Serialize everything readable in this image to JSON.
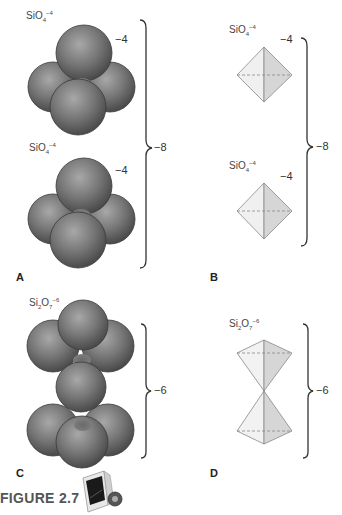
{
  "figure": {
    "caption": "FIGURE 2.7",
    "icon": "animation-monitor-icon"
  },
  "panels": {
    "A": {
      "label": "A",
      "type": "space-filling",
      "top": {
        "formula_base": "SiO",
        "formula_sub": "4",
        "formula_sup": "−4",
        "charge": "−4"
      },
      "bottom": {
        "formula_base": "SiO",
        "formula_sub": "4",
        "formula_sup": "−4",
        "charge": "−4"
      },
      "total_charge": "−8"
    },
    "B": {
      "label": "B",
      "type": "polyhedral",
      "top": {
        "formula_base": "SiO",
        "formula_sub": "4",
        "formula_sup": "−4",
        "charge": "−4"
      },
      "bottom": {
        "formula_base": "SiO",
        "formula_sub": "4",
        "formula_sup": "−4",
        "charge": "−4"
      },
      "total_charge": "−8"
    },
    "C": {
      "label": "C",
      "type": "space-filling",
      "formula_base1": "Si",
      "formula_sub1": "2",
      "formula_base2": "O",
      "formula_sub2": "7",
      "formula_sup": "−6",
      "total_charge": "−6"
    },
    "D": {
      "label": "D",
      "type": "polyhedral",
      "formula_base1": "Si",
      "formula_sub1": "2",
      "formula_base2": "O",
      "formula_sub2": "7",
      "formula_sup": "−6",
      "total_charge": "−6"
    }
  },
  "colors": {
    "sphere_dark": "#4a4a4a",
    "sphere_light": "#9a9a9a",
    "tetra_light": "#f0f0f0",
    "tetra_shade": "#d4d4d4",
    "line": "#333333"
  }
}
